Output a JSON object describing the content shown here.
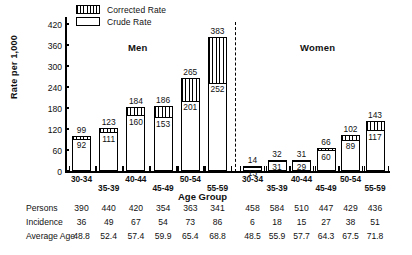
{
  "legend": {
    "items": [
      {
        "label": "Corrected Rate",
        "style": "hatch",
        "icon": "hatched-box-swatch"
      },
      {
        "label": "Crude Rate",
        "style": "open",
        "icon": "open-box-swatch"
      }
    ]
  },
  "axes": {
    "y_title": "Rate per 1,000",
    "y_ticks": [
      "0",
      "60",
      "120",
      "180",
      "240",
      "300",
      "360",
      "420"
    ],
    "x_title": "Age Group"
  },
  "panels": [
    {
      "label": "Men"
    },
    {
      "label": "Women"
    }
  ],
  "chart_data": {
    "type": "bar",
    "title": "",
    "xlabel": "Age Group",
    "ylabel": "Rate per 1,000",
    "ylim": [
      0,
      440
    ],
    "ytick_values": [
      0,
      60,
      120,
      180,
      240,
      300,
      360,
      420
    ],
    "grid": false,
    "legend_position": "top-left",
    "panels": [
      "Men",
      "Women"
    ],
    "categories": [
      "30-34",
      "35-39",
      "40-44",
      "45-49",
      "50-54",
      "55-59"
    ],
    "series": [
      {
        "name": "Corrected Rate",
        "panel": "Men",
        "values": [
          99,
          123,
          184,
          186,
          265,
          383
        ]
      },
      {
        "name": "Crude Rate",
        "panel": "Men",
        "values": [
          92,
          111,
          160,
          153,
          201,
          252
        ]
      },
      {
        "name": "Corrected Rate",
        "panel": "Women",
        "values": [
          14,
          32,
          31,
          66,
          102,
          143
        ]
      },
      {
        "name": "Crude Rate",
        "panel": "Women",
        "values": [
          13,
          31,
          29,
          60,
          89,
          117
        ]
      }
    ],
    "table": {
      "row_labels": [
        "Persons",
        "Incidence",
        "Average Age"
      ],
      "men": {
        "Persons": [
          "390",
          "440",
          "420",
          "354",
          "363",
          "341"
        ],
        "Incidence": [
          "36",
          "49",
          "67",
          "54",
          "73",
          "86"
        ],
        "Average Age": [
          "48.8",
          "52.4",
          "57.4",
          "59.9",
          "65.4",
          "68.8"
        ]
      },
      "women": {
        "Persons": [
          "458",
          "584",
          "510",
          "447",
          "429",
          "436"
        ],
        "Incidence": [
          "6",
          "18",
          "15",
          "27",
          "38",
          "51"
        ],
        "Average Age": [
          "48.5",
          "55.9",
          "57.7",
          "64.3",
          "67.5",
          "71.8"
        ]
      }
    }
  }
}
